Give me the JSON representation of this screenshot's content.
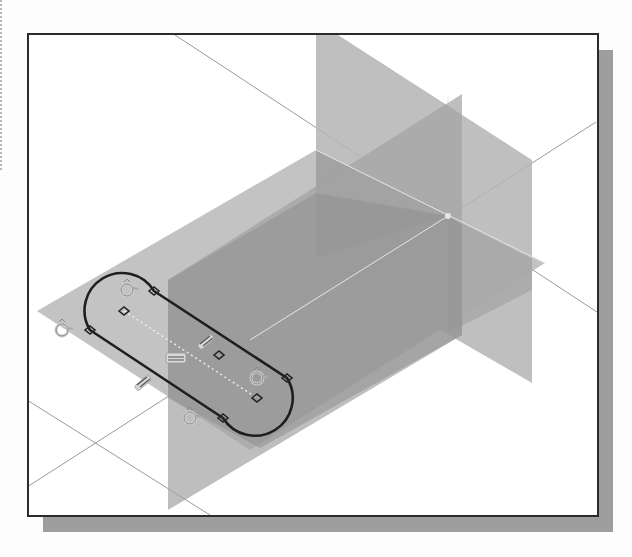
{
  "scene": {
    "description": "3D CAD sketch viewport showing three datum planes with a slot-shaped sketch and constraint symbols",
    "view": "isometric",
    "colors": {
      "background": "#ffffff",
      "frame_border": "#2b2b2b",
      "frame_shadow": "#9e9e9e",
      "horizontal_plane": "#b9b9b9",
      "front_vertical_plane": "#a3a3a3",
      "side_vertical_plane": "#b4b4b4",
      "plane_overlap": "#8c8c8c",
      "axis_lines": "#9a9a9a",
      "sketch_profile": "#1e1e1e",
      "constraint_symbols": "#cfcfcf"
    },
    "origin": {
      "x": 448,
      "y": 216
    },
    "datum_planes": [
      {
        "name": "horizontal-plane",
        "points": [
          [
            37,
            311
          ],
          [
            316,
            150
          ],
          [
            545,
            263
          ],
          [
            250,
            450
          ]
        ]
      },
      {
        "name": "front-vertical-plane",
        "points": [
          [
            168,
            280
          ],
          [
            462,
            94
          ],
          [
            462,
            335
          ],
          [
            168,
            510
          ]
        ]
      },
      {
        "name": "side-vertical-plane",
        "points": [
          [
            316,
            35
          ],
          [
            338,
            35
          ],
          [
            532,
            160
          ],
          [
            532,
            383
          ],
          [
            316,
            258
          ]
        ]
      }
    ],
    "sketch": {
      "type": "slot",
      "center_points": [
        [
          124,
          311
        ],
        [
          257,
          398
        ]
      ],
      "radius": 36,
      "constraint_symbols": {
        "tangent": [
          [
            62,
            330
          ],
          [
            127,
            290
          ],
          [
            257,
            378
          ],
          [
            190,
            418
          ]
        ],
        "coincident_nodes": [
          [
            154,
            291
          ],
          [
            90,
            330
          ],
          [
            287,
            378
          ],
          [
            223,
            418
          ]
        ],
        "center_nodes": [
          [
            124,
            311
          ],
          [
            219,
            355
          ],
          [
            257,
            398
          ]
        ],
        "parallel": [
          [
            206,
            342
          ],
          [
            143,
            383
          ]
        ],
        "horizontal": [
          [
            176,
            356
          ]
        ]
      }
    }
  }
}
